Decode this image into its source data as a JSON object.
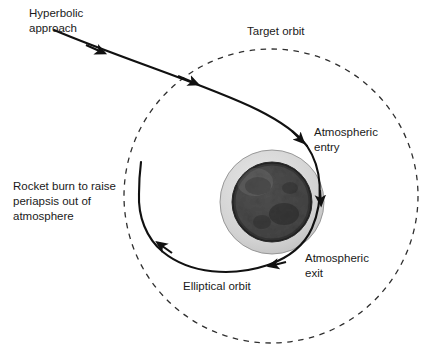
{
  "figure": {
    "background_color": "#ffffff",
    "line_color": "#1a1a1a",
    "text_color": "#1a1a1a"
  },
  "labels": {
    "hyperbolic_approach_line1": "Hyperbolic",
    "hyperbolic_approach_line2": "approach",
    "target_orbit": "Target orbit",
    "atmospheric_entry_line1": "Atmospheric",
    "atmospheric_entry_line2": "entry",
    "atmospheric_exit_line1": "Atmospheric",
    "atmospheric_exit_line2": "exit",
    "rocket_burn_line1": "Rocket burn to raise",
    "rocket_burn_line2": "periapsis out of",
    "rocket_burn_line3": "atmosphere",
    "elliptical_orbit": "Elliptical orbit"
  },
  "geometry": {
    "target_orbit": {
      "shape": "dashed-circle",
      "center_x": 271,
      "center_y": 196,
      "radius": 147,
      "dash": "6 6",
      "stroke": "#333333"
    },
    "planet": {
      "center_x": 272,
      "center_y": 202,
      "body_radius": 40,
      "atmosphere_radius": 52,
      "atmosphere_color": "#d4d4d4",
      "body_color": "#3a3a3a"
    },
    "trajectory_color": "#111111"
  }
}
